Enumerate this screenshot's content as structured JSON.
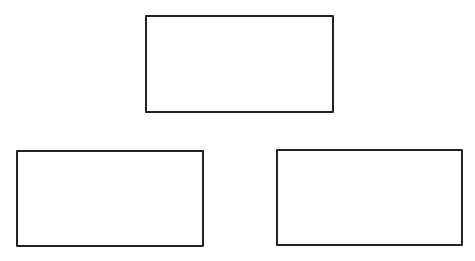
{
  "diagram": {
    "background": "#ffffff",
    "stroke_color": "#222222",
    "stroke_width": 2,
    "nodes": [
      {
        "id": "top",
        "label": "",
        "x": 145,
        "y": 15,
        "width": 189,
        "height": 98
      },
      {
        "id": "bottom-left",
        "label": "",
        "x": 16,
        "y": 150,
        "width": 188,
        "height": 97
      },
      {
        "id": "bottom-right",
        "label": "",
        "x": 276,
        "y": 149,
        "width": 187,
        "height": 97
      }
    ],
    "edges": []
  }
}
